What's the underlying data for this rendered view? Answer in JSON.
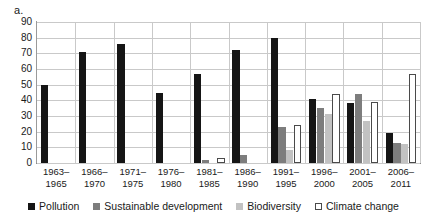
{
  "panel_label": "a.",
  "chart_data": {
    "type": "bar",
    "title": "",
    "subtitle": "",
    "xlabel": "",
    "ylabel": "",
    "ylim": [
      0,
      90
    ],
    "ytick_step": 10,
    "yticks": [
      90,
      80,
      70,
      60,
      50,
      40,
      30,
      20,
      10,
      0
    ],
    "grid": true,
    "legend_position": "bottom",
    "categories": [
      "1963–1965",
      "1966–1970",
      "1971–1975",
      "1976–1980",
      "1981–1985",
      "1986–1990",
      "1991–1995",
      "1996–2000",
      "2001–2005",
      "2006–2011"
    ],
    "category_lines": [
      [
        "1963–",
        "1965"
      ],
      [
        "1966–",
        "1970"
      ],
      [
        "1971–",
        "1975"
      ],
      [
        "1976–",
        "1980"
      ],
      [
        "1981–",
        "1985"
      ],
      [
        "1986–",
        "1990"
      ],
      [
        "1991–",
        "1995"
      ],
      [
        "1996–",
        "2000"
      ],
      [
        "2001–",
        "2005"
      ],
      [
        "2006–",
        "2011"
      ]
    ],
    "series": [
      {
        "name": "Pollution",
        "color": "#151515",
        "values": [
          50,
          71,
          76,
          45,
          57,
          72,
          80,
          41,
          38,
          19
        ]
      },
      {
        "name": "Sustainable development",
        "color": "#7d7d7d",
        "values": [
          0,
          0,
          0,
          0,
          2,
          5,
          23,
          35,
          44,
          13
        ]
      },
      {
        "name": "Biodiversity",
        "color": "#c2c2c2",
        "values": [
          0,
          0,
          0,
          0,
          0,
          0,
          8,
          31,
          27,
          12
        ]
      },
      {
        "name": "Climate change",
        "color": "#ffffff",
        "values": [
          0,
          0,
          0,
          0,
          3,
          0,
          24,
          44,
          39,
          57
        ]
      }
    ]
  },
  "legend": {
    "items": [
      {
        "label": "Pollution",
        "swatch": "pollution"
      },
      {
        "label": "Sustainable development",
        "swatch": "sustainable"
      },
      {
        "label": "Biodiversity",
        "swatch": "biodiversity"
      },
      {
        "label": "Climate change",
        "swatch": "climate"
      }
    ]
  }
}
